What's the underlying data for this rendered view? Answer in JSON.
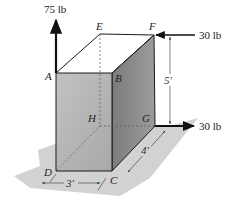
{
  "diagram": {
    "title": "",
    "points": {
      "A": "A",
      "B": "B",
      "C": "C",
      "D": "D",
      "E": "E",
      "F": "F",
      "G": "G",
      "H": "H"
    },
    "forces": [
      {
        "id": "vertical-force",
        "label": "75 lb",
        "point": "A",
        "direction": "up"
      },
      {
        "id": "top-force",
        "label": "30 lb",
        "point": "F",
        "direction": "left"
      },
      {
        "id": "bottom-force",
        "label": "30 lb",
        "point": "G",
        "direction": "right"
      }
    ],
    "dimensions": {
      "width": "3′",
      "depth": "4′",
      "height": "5′"
    },
    "colors": {
      "front_face": "#b5b5b5",
      "side_face": "#8a8a8a",
      "ground": "#d0d0d0",
      "lines": "#1a1a1a"
    }
  }
}
